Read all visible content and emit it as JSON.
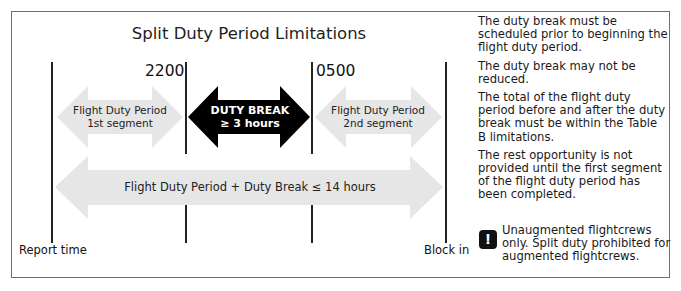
{
  "diagram": {
    "title": "Split Duty Period Limitations",
    "times": {
      "start_break": "2200",
      "end_break": "0500"
    },
    "endpoints": {
      "left": "Report time",
      "right": "Block in"
    },
    "arrows": {
      "segment1": {
        "line1": "Flight Duty Period",
        "line2": "1st segment"
      },
      "duty_break": {
        "line1": "DUTY BREAK",
        "line2": "≥ 3 hours"
      },
      "segment2": {
        "line1": "Flight Duty Period",
        "line2": "2nd segment"
      },
      "total": {
        "label": "Flight Duty Period + Duty Break ≤ 14 hours"
      }
    },
    "colors": {
      "light_arrow": "#e6e6e6",
      "dark_arrow": "#000000",
      "lines": "#222222"
    }
  },
  "notes": [
    "The duty break must be scheduled prior to beginning the flight duty period.",
    "The duty break may not be reduced.",
    "The total of the flight duty period before and after the duty break must be within the Table B limitations.",
    "The rest opportunity is not provided until the first segment of the flight duty period has been completed."
  ],
  "warning": {
    "icon": "exclamation-icon",
    "glyph": "!",
    "text": "Unaugmented flightcrews only. Split duty prohibited for augmented flightcrews."
  }
}
